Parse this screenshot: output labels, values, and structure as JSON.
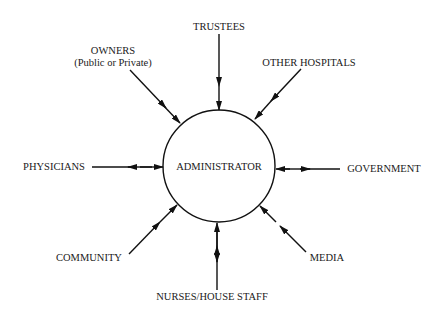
{
  "center": {
    "label": "ADMINISTRATOR"
  },
  "nodes": [
    {
      "id": "trustees",
      "label": "TRUSTEES"
    },
    {
      "id": "owners",
      "label": "OWNERS",
      "sublabel": "(Public or Private)"
    },
    {
      "id": "other-hospitals",
      "label": "OTHER HOSPITALS"
    },
    {
      "id": "physicians",
      "label": "PHYSICIANS"
    },
    {
      "id": "government",
      "label": "GOVERNMENT"
    },
    {
      "id": "community",
      "label": "COMMUNITY"
    },
    {
      "id": "media",
      "label": "MEDIA"
    },
    {
      "id": "nurses",
      "label": "NURSES/HOUSE STAFF"
    }
  ],
  "edges": [
    {
      "from": "trustees",
      "to": "administrator",
      "type": "bidirectional"
    },
    {
      "from": "owners",
      "to": "administrator",
      "type": "bidirectional"
    },
    {
      "from": "other-hospitals",
      "to": "administrator",
      "type": "bidirectional"
    },
    {
      "from": "physicians",
      "to": "administrator",
      "type": "bidirectional"
    },
    {
      "from": "government",
      "to": "administrator",
      "type": "bidirectional"
    },
    {
      "from": "community",
      "to": "administrator",
      "type": "bidirectional"
    },
    {
      "from": "media",
      "to": "administrator",
      "type": "bidirectional"
    },
    {
      "from": "nurses",
      "to": "administrator",
      "type": "bidirectional"
    }
  ]
}
